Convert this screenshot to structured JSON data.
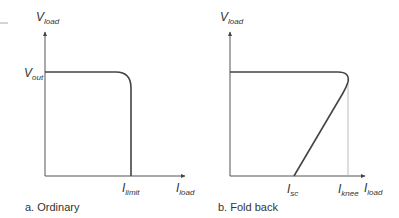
{
  "panels": [
    {
      "id": "ordinary",
      "caption": "a. Ordinary",
      "y_axis_label": {
        "main": "V",
        "sub": "load"
      },
      "x_axis_label": {
        "main": "I",
        "sub": "load"
      },
      "y_tick_label": {
        "main": "V",
        "sub": "out"
      },
      "x_tick_labels": [
        {
          "main": "I",
          "sub": "limit"
        }
      ]
    },
    {
      "id": "fold-back",
      "caption": "b. Fold back",
      "y_axis_label": {
        "main": "V",
        "sub": "load"
      },
      "x_axis_label": {
        "main": "I",
        "sub": "load"
      },
      "x_tick_labels": [
        {
          "main": "I",
          "sub": "sc"
        },
        {
          "main": "I",
          "sub": "knee"
        }
      ]
    }
  ],
  "colors": {
    "curve": "#444444",
    "axis": "#555555",
    "guide": "#999999",
    "text": "#333333"
  }
}
